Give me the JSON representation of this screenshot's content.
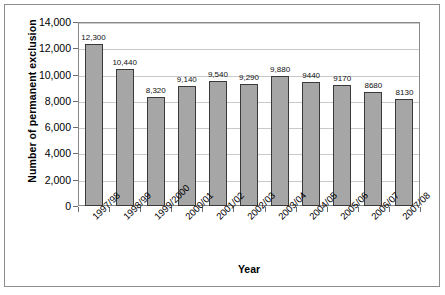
{
  "figure": {
    "y_axis_title": "Number of permanent exclusion",
    "x_axis_title": "Year"
  },
  "chart_data": {
    "type": "bar",
    "title": "",
    "xlabel": "Year",
    "ylabel": "Number of permanent exclusion",
    "ylim": [
      0,
      14000
    ],
    "ytick_step": 2000,
    "grid": true,
    "legend": false,
    "bar_color": "#a6a6a6",
    "bar_border_color": "#3a3a3a",
    "categories": [
      "1997/98",
      "1998/99",
      "1999/2000",
      "2000/01",
      "2001/02",
      "2002/03",
      "2003/04",
      "2004/05",
      "2005/06",
      "2006/07",
      "2007/08"
    ],
    "values": [
      12300,
      10440,
      8320,
      9140,
      9540,
      9290,
      9880,
      9440,
      9170,
      8680,
      8130
    ],
    "data_labels": [
      "12,300",
      "10,440",
      "8,320",
      "9,140",
      "9,540",
      "9,290",
      "9,880",
      "9440",
      "9170",
      "8680",
      "8130"
    ],
    "ytick_labels": [
      "0",
      "2,000",
      "4,000",
      "6,000",
      "8,000",
      "10,000",
      "12,000",
      "14,000"
    ],
    "ytick_values": [
      0,
      2000,
      4000,
      6000,
      8000,
      10000,
      12000,
      14000
    ]
  }
}
